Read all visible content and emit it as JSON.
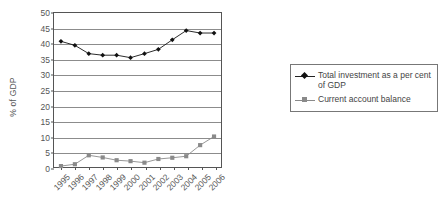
{
  "chart_data": {
    "type": "line",
    "title": "",
    "xlabel": "",
    "ylabel": "% of GDP",
    "ylim": [
      0,
      50
    ],
    "ytick_step": 5,
    "yticks": [
      0,
      5,
      10,
      15,
      20,
      25,
      30,
      35,
      40,
      45,
      50
    ],
    "grid": "horizontal",
    "legend_position": "right",
    "categories": [
      "1995",
      "1996",
      "1997",
      "1998",
      "1999",
      "2000",
      "2001",
      "2002",
      "2003",
      "2004",
      "2005",
      "2006"
    ],
    "series": [
      {
        "name": "Total investment as a per cent of GDP",
        "marker": "diamond",
        "color": "#111111",
        "values": [
          40.8,
          39.5,
          36.8,
          36.3,
          36.3,
          35.5,
          36.8,
          38.2,
          41.3,
          44.3,
          43.5,
          43.5
        ]
      },
      {
        "name": "Current account balance",
        "marker": "square",
        "color": "#8a8a8a",
        "values": [
          0.3,
          0.9,
          3.8,
          3.1,
          2.2,
          1.9,
          1.4,
          2.6,
          3.0,
          3.5,
          7.1,
          9.9
        ]
      }
    ]
  },
  "axis": {
    "y_title": "% of GDP"
  },
  "legend": {
    "entries": [
      {
        "label": "Total investment as a per cent of GDP",
        "marker": "diamond-marker",
        "color": "#111111"
      },
      {
        "label": "Current account balance",
        "marker": "square-marker",
        "color": "#8a8a8a"
      }
    ]
  }
}
